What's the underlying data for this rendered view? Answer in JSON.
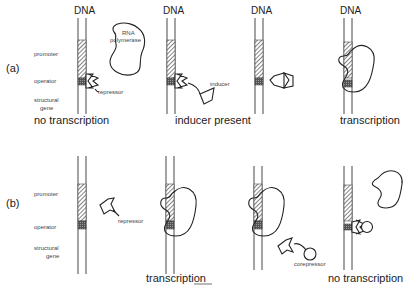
{
  "figure": {
    "row_a": {
      "label": "(a)",
      "region_labels": {
        "promoter": "promoter",
        "operator": "operator",
        "structural_1": "structural",
        "structural_2": "gene"
      },
      "panels": [
        {
          "dna_label": "DNA",
          "caption": "no transcription",
          "annotations": {
            "rna_1": "RNA",
            "rna_2": "polymerase",
            "repressor": "repressor"
          }
        },
        {
          "dna_label": "DNA",
          "caption": "inducer  present",
          "annotations": {
            "inducer": "inducer"
          }
        },
        {
          "dna_label": "DNA",
          "caption": ""
        },
        {
          "dna_label": "DNA",
          "caption": "transcription"
        }
      ]
    },
    "row_b": {
      "label": "(b)",
      "region_labels": {
        "promoter": "promoter",
        "operator": "operator",
        "structural_1": "structural",
        "structural_2": "gene"
      },
      "panels": [
        {
          "caption": "",
          "annotations": {
            "repressor": "repressor"
          }
        },
        {
          "caption": "transcription"
        },
        {
          "caption": "",
          "annotations": {
            "corepressor": "corepressor"
          }
        },
        {
          "caption": "no  transcription"
        }
      ]
    }
  },
  "colors": {
    "ink": "#222222",
    "background": "#ffffff"
  }
}
